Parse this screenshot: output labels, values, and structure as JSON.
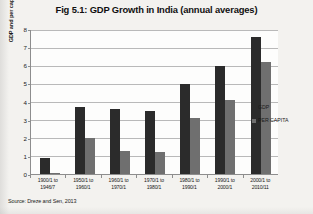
{
  "figure": {
    "title": "Fig 5.1: GDP Growth in India (annual averages)",
    "source": "Source: Dreze and Sen, 2013"
  },
  "legend": {
    "items": [
      {
        "label": "GDP",
        "color": "#2b2b2b",
        "name": "legend-gdp"
      },
      {
        "label": "PER CAPITA",
        "color": "#6f6f6f",
        "name": "legend-per-capita"
      }
    ]
  },
  "chart_data": {
    "type": "bar",
    "title": "Fig 5.1: GDP Growth in India (annual averages)",
    "xlabel": "",
    "ylabel": "GDP and per capital growth",
    "ylim": [
      0,
      8
    ],
    "yticks": [
      0,
      1,
      2,
      3,
      4,
      5,
      6,
      7,
      8
    ],
    "grid": true,
    "legend_position": "right",
    "categories": [
      "1900/1 to 1946/7",
      "1950/1 to 1960/1",
      "1960/1 to 1970/1",
      "1970/1 to 1980/1",
      "1980/1 to 1990/1",
      "1990/1 to 2000/1",
      "2000/1 to 2010/11"
    ],
    "series": [
      {
        "name": "GDP",
        "color": "#2b2b2b",
        "values": [
          0.9,
          3.7,
          3.6,
          3.5,
          5.0,
          6.0,
          7.6
        ]
      },
      {
        "name": "PER CAPITA",
        "color": "#6f6f6f",
        "values": [
          0.05,
          2.0,
          1.3,
          1.2,
          3.1,
          4.1,
          6.2
        ]
      }
    ]
  }
}
